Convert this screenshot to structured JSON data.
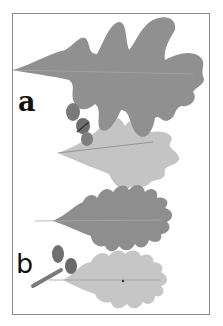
{
  "figure": {
    "panels": [
      {
        "id": "a",
        "label": "a",
        "description": "Lobed oak leaves (upper and lower surface) with acorns"
      },
      {
        "id": "b",
        "label": "b",
        "description": "Shallow-lobed oak leaves (upper and lower surface) with stalked acorns"
      }
    ],
    "colors": {
      "frame": "#8a8a8a",
      "leaf_dark": "#8f8f8f",
      "leaf_light": "#c4c4c4",
      "acorn": "#777777"
    }
  }
}
